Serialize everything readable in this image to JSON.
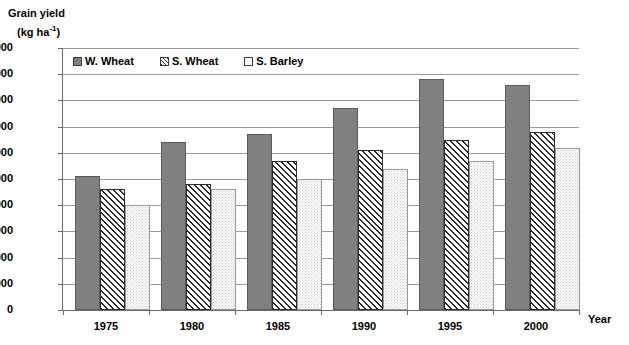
{
  "chart_data": {
    "type": "bar",
    "title": "",
    "ylabel_line1": "Grain yield",
    "ylabel_line2_pre": "(kg ha",
    "ylabel_line2_sup": "-1",
    "ylabel_line2_post": ")",
    "xlabel": "Year",
    "categories": [
      "1975",
      "1980",
      "1985",
      "1990",
      "1995",
      "2000"
    ],
    "ylim": [
      0,
      10000
    ],
    "ytick_labels": [
      "10,000",
      "9,000",
      "8,000",
      "7,000",
      "6,000",
      "5,000",
      "4,000",
      "3,000",
      "2,000",
      "1,000",
      "0"
    ],
    "ytick_values": [
      10000,
      9000,
      8000,
      7000,
      6000,
      5000,
      4000,
      3000,
      2000,
      1000,
      0
    ],
    "grid": true,
    "legend_position": "top-left-inside",
    "series": [
      {
        "name": "W. Wheat",
        "pattern": "solid-gray",
        "color": "#808080",
        "values": [
          5100,
          6400,
          6700,
          7700,
          8800,
          8600
        ]
      },
      {
        "name": "S. Wheat",
        "pattern": "diagonal-hatch",
        "color": "#2b2b2b",
        "values": [
          4600,
          4800,
          5700,
          6100,
          6500,
          6800
        ]
      },
      {
        "name": "S. Barley",
        "pattern": "dotted-open",
        "color": "#fbfbfb",
        "values": [
          4000,
          4600,
          5000,
          5400,
          5700,
          6200
        ]
      }
    ]
  }
}
